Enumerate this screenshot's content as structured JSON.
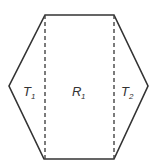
{
  "diagram": {
    "shape": "hexagon",
    "stroke_color": "#333333",
    "dashed_color": "#444444",
    "regions": [
      {
        "id": "T1",
        "label": "T",
        "subscript": "1"
      },
      {
        "id": "R1",
        "label": "R",
        "subscript": "1"
      },
      {
        "id": "T2",
        "label": "T",
        "subscript": "2"
      }
    ]
  }
}
